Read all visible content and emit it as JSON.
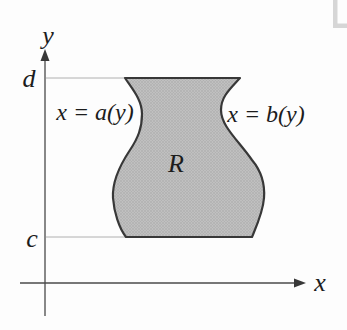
{
  "figure": {
    "y_axis_label": "y",
    "x_axis_label": "x",
    "upper_bound_label": "d",
    "lower_bound_label": "c",
    "region_label": "R",
    "left_curve_label": "x = a(y)",
    "right_curve_label": "x = b(y)"
  },
  "colors": {
    "background": "#fdfdfd",
    "region_fill_average": "#b8b8b8",
    "region_stipple_dot": "#a3a3a3",
    "region_outline": "#383838",
    "axis": "#4a4a4a",
    "guide_line": "#b0b0b0",
    "text": "#1c1c1c",
    "corner_accent": "#cccccc"
  }
}
